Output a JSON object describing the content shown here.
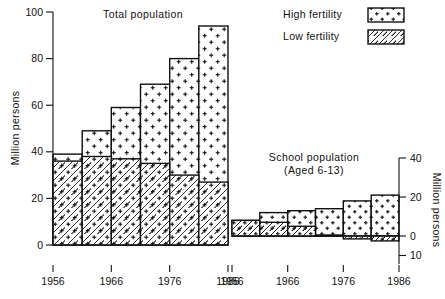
{
  "figure": {
    "background": "#ffffff",
    "ink": "#111111"
  },
  "legend": {
    "position": "top-right",
    "items": [
      {
        "label": "High fertility",
        "pattern": "dots"
      },
      {
        "label": "Low fertility",
        "pattern": "diagonal-hatch"
      }
    ]
  },
  "chart_data": [
    {
      "type": "bar",
      "id": "total-population",
      "title": "Total population",
      "xlabel": "",
      "ylabel": "Million persons",
      "ylim": [
        0,
        100
      ],
      "yticks": [
        0,
        20,
        40,
        60,
        80,
        100
      ],
      "ytick_labels": [
        "0",
        "20",
        "40",
        "60",
        "80",
        "100"
      ],
      "grid": false,
      "x": [
        1956,
        1961,
        1966,
        1971,
        1976,
        1981,
        1986
      ],
      "categories": [
        "1956",
        "1961",
        "1966",
        "1971",
        "1976",
        "1981",
        "1986"
      ],
      "tick_labels_shown": [
        "1956",
        "1966",
        "1976",
        "1986"
      ],
      "n_bars": 6,
      "series": [
        {
          "name": "High fertility",
          "pattern": "dots",
          "values": [
            39,
            49,
            59,
            69,
            80,
            94
          ]
        },
        {
          "name": "Low fertility",
          "pattern": "diagonal-hatch",
          "values": [
            36,
            38,
            37,
            35,
            30,
            27
          ]
        }
      ]
    },
    {
      "type": "bar",
      "id": "school-population",
      "title": "School population",
      "subtitle": "(Aged 6-13)",
      "xlabel": "",
      "ylabel": "Million persons",
      "ylim": [
        -10,
        40
      ],
      "yticks": [
        -10,
        0,
        20,
        40
      ],
      "ytick_labels": [
        "10",
        "0",
        "20",
        "40"
      ],
      "grid": false,
      "x": [
        1956,
        1961,
        1966,
        1971,
        1976,
        1981,
        1986
      ],
      "categories": [
        "1956",
        "1961",
        "1966",
        "1971",
        "1976",
        "1981",
        "1986"
      ],
      "tick_labels_shown": [
        "1956",
        "1966",
        "1976",
        "1986"
      ],
      "n_bars": 6,
      "series": [
        {
          "name": "High fertility",
          "pattern": "dots",
          "values": [
            8,
            12,
            13,
            14,
            18,
            21
          ]
        },
        {
          "name": "Low fertility",
          "pattern": "diagonal-hatch",
          "values": [
            8,
            7,
            5,
            0.5,
            -1.5,
            -2.5
          ]
        }
      ]
    }
  ]
}
